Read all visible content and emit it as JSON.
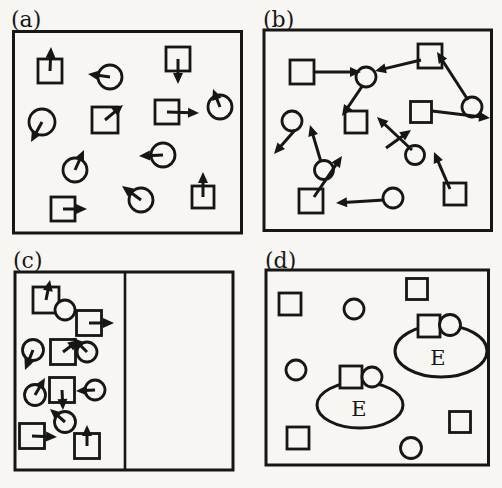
{
  "figure": {
    "paper_color": "#f7f6f2",
    "ink_color": "#161616",
    "panels": [
      {
        "id": "a",
        "label": "(a)",
        "label_x": 11,
        "label_y": 27,
        "box": {
          "x": 13.5,
          "y": 31.5,
          "w": 228,
          "h": 201.5
        },
        "shapes": [
          {
            "type": "square",
            "cx": 50,
            "cy": 71,
            "size": 24,
            "arrow_to": {
              "x": 51,
              "y": 47
            }
          },
          {
            "type": "circle",
            "cx": 110,
            "cy": 77,
            "r": 12,
            "arrow_to": {
              "x": 88,
              "y": 74
            }
          },
          {
            "type": "square",
            "cx": 178,
            "cy": 59,
            "size": 24,
            "arrow_to": {
              "x": 178,
              "y": 84
            }
          },
          {
            "type": "circle",
            "cx": 42,
            "cy": 122,
            "r": 13,
            "arrow_to": {
              "x": 31,
              "y": 142
            }
          },
          {
            "type": "square",
            "cx": 105,
            "cy": 120,
            "size": 26,
            "arrow_to": {
              "x": 123,
              "y": 105
            }
          },
          {
            "type": "square",
            "cx": 167,
            "cy": 112,
            "size": 24,
            "arrow_to": {
              "x": 199,
              "y": 113
            }
          },
          {
            "type": "circle",
            "cx": 220,
            "cy": 107,
            "r": 12,
            "arrow_to": {
              "x": 213,
              "y": 89
            }
          },
          {
            "type": "circle",
            "cx": 75,
            "cy": 170,
            "r": 12,
            "arrow_to": {
              "x": 84,
              "y": 150
            }
          },
          {
            "type": "circle",
            "cx": 163,
            "cy": 155,
            "r": 12,
            "arrow_to": {
              "x": 139,
              "y": 156
            }
          },
          {
            "type": "square",
            "cx": 63,
            "cy": 209,
            "size": 24,
            "arrow_to": {
              "x": 87,
              "y": 209
            }
          },
          {
            "type": "circle",
            "cx": 141,
            "cy": 200,
            "r": 12,
            "arrow_to": {
              "x": 122,
              "y": 186
            }
          },
          {
            "type": "square",
            "cx": 203,
            "cy": 197,
            "size": 22,
            "arrow_to": {
              "x": 203,
              "y": 172
            }
          }
        ],
        "arrows": [],
        "complexes": []
      },
      {
        "id": "b",
        "label": "(b)",
        "label_x": 263,
        "label_y": 27,
        "box": {
          "x": 264,
          "y": 30,
          "w": 227.5,
          "h": 200.5
        },
        "shapes": [
          {
            "type": "square",
            "cx": 302,
            "cy": 72,
            "size": 24
          },
          {
            "type": "circle",
            "cx": 366,
            "cy": 77,
            "r": 10
          },
          {
            "type": "square",
            "cx": 430,
            "cy": 56,
            "size": 24
          },
          {
            "type": "circle",
            "cx": 472,
            "cy": 107,
            "r": 10
          },
          {
            "type": "square",
            "cx": 421,
            "cy": 112,
            "size": 21
          },
          {
            "type": "circle",
            "cx": 292,
            "cy": 121,
            "r": 10
          },
          {
            "type": "square",
            "cx": 356,
            "cy": 122,
            "size": 22
          },
          {
            "type": "circle",
            "cx": 415,
            "cy": 155,
            "r": 9.5
          },
          {
            "type": "circle",
            "cx": 324,
            "cy": 170,
            "r": 9.5
          },
          {
            "type": "square",
            "cx": 311,
            "cy": 201,
            "size": 24
          },
          {
            "type": "circle",
            "cx": 393,
            "cy": 198,
            "r": 10
          },
          {
            "type": "square",
            "cx": 455,
            "cy": 194,
            "size": 22
          }
        ],
        "arrows": [
          {
            "x1": 314,
            "y1": 72,
            "x2": 361,
            "y2": 72
          },
          {
            "x1": 421,
            "y1": 60,
            "x2": 375,
            "y2": 71
          },
          {
            "x1": 468,
            "y1": 100,
            "x2": 437,
            "y2": 52
          },
          {
            "x1": 432,
            "y1": 111,
            "x2": 490,
            "y2": 118
          },
          {
            "x1": 363,
            "y1": 85,
            "x2": 342,
            "y2": 116
          },
          {
            "x1": 295,
            "y1": 130,
            "x2": 274,
            "y2": 154
          },
          {
            "x1": 412,
            "y1": 150,
            "x2": 377,
            "y2": 117
          },
          {
            "x1": 386,
            "y1": 148,
            "x2": 411,
            "y2": 130
          },
          {
            "x1": 321,
            "y1": 162,
            "x2": 310,
            "y2": 125
          },
          {
            "x1": 314,
            "y1": 197,
            "x2": 342,
            "y2": 156
          },
          {
            "x1": 384,
            "y1": 200,
            "x2": 336,
            "y2": 203
          },
          {
            "x1": 450,
            "y1": 189,
            "x2": 434,
            "y2": 152
          }
        ],
        "complexes": []
      },
      {
        "id": "c",
        "label": "(c)",
        "label_x": 13,
        "label_y": 268,
        "box": {
          "x": 15,
          "y": 272,
          "w": 218,
          "h": 198
        },
        "divider_x": 125,
        "shapes": [
          {
            "type": "square",
            "cx": 46,
            "cy": 300,
            "size": 26,
            "arrow_to": {
              "x": 50,
              "y": 280
            }
          },
          {
            "type": "circle",
            "cx": 65,
            "cy": 310,
            "r": 10
          },
          {
            "type": "square",
            "cx": 89,
            "cy": 323,
            "size": 25,
            "arrow_to": {
              "x": 114,
              "y": 323
            }
          },
          {
            "type": "circle",
            "cx": 33,
            "cy": 350,
            "r": 10.5,
            "arrow_to": {
              "x": 25,
              "y": 370
            }
          },
          {
            "type": "square",
            "cx": 63,
            "cy": 352,
            "size": 25,
            "arrow_to": {
              "x": 79,
              "y": 340
            }
          },
          {
            "type": "circle",
            "cx": 87,
            "cy": 352,
            "r": 10,
            "arrow_to": {
              "x": 73,
              "y": 338
            }
          },
          {
            "type": "circle",
            "cx": 35,
            "cy": 395,
            "r": 10.5,
            "arrow_to": {
              "x": 45,
              "y": 378
            }
          },
          {
            "type": "square",
            "cx": 62,
            "cy": 390,
            "size": 25,
            "arrow_to": {
              "x": 63,
              "y": 410
            }
          },
          {
            "type": "circle",
            "cx": 95,
            "cy": 390,
            "r": 10,
            "arrow_to": {
              "x": 76,
              "y": 391
            }
          },
          {
            "type": "circle",
            "cx": 65,
            "cy": 422,
            "r": 10.5,
            "arrow_to": {
              "x": 50,
              "y": 409
            }
          },
          {
            "type": "square",
            "cx": 32,
            "cy": 436,
            "size": 25,
            "arrow_to": {
              "x": 57,
              "y": 437
            }
          },
          {
            "type": "square",
            "cx": 87,
            "cy": 446,
            "size": 25,
            "arrow_to": {
              "x": 87,
              "y": 425
            }
          }
        ],
        "arrows": [],
        "complexes": []
      },
      {
        "id": "d",
        "label": "(d)",
        "label_x": 265,
        "label_y": 268,
        "box": {
          "x": 266,
          "y": 270,
          "w": 222.5,
          "h": 195
        },
        "shapes": [
          {
            "type": "square",
            "cx": 290,
            "cy": 304,
            "size": 22
          },
          {
            "type": "circle",
            "cx": 354,
            "cy": 309,
            "r": 10
          },
          {
            "type": "square",
            "cx": 417,
            "cy": 289,
            "size": 21
          },
          {
            "type": "circle",
            "cx": 296,
            "cy": 370,
            "r": 10
          },
          {
            "type": "square",
            "cx": 460,
            "cy": 422,
            "size": 21
          },
          {
            "type": "square",
            "cx": 298,
            "cy": 438,
            "size": 22
          },
          {
            "type": "circle",
            "cx": 411,
            "cy": 448,
            "r": 10.5
          }
        ],
        "arrows": [],
        "complexes": [
          {
            "ellipse": {
              "cx": 441,
              "cy": 351,
              "rx": 46,
              "ry": 26
            },
            "square": {
              "cx": 429,
              "cy": 326,
              "size": 22
            },
            "circle": {
              "cx": 450,
              "cy": 325,
              "r": 10.5
            },
            "label": "E",
            "label_x": 438,
            "label_y": 365
          },
          {
            "ellipse": {
              "cx": 360,
              "cy": 405,
              "rx": 43,
              "ry": 23
            },
            "square": {
              "cx": 351,
              "cy": 377,
              "size": 22
            },
            "circle": {
              "cx": 372,
              "cy": 377,
              "r": 10
            },
            "label": "E",
            "label_x": 359,
            "label_y": 416
          }
        ]
      }
    ]
  }
}
